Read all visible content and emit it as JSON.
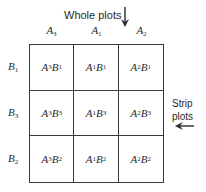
{
  "diagram": {
    "whole_plots_label": "Whole plots",
    "strip_plots_label": [
      "Strip",
      "plots"
    ],
    "columns": [
      {
        "factor": "A",
        "sub": "3"
      },
      {
        "factor": "A",
        "sub": "1"
      },
      {
        "factor": "A",
        "sub": "2"
      }
    ],
    "rows": [
      {
        "factor": "B",
        "sub": "1"
      },
      {
        "factor": "B",
        "sub": "3"
      },
      {
        "factor": "B",
        "sub": "2"
      }
    ],
    "cells": [
      [
        [
          "3",
          "1"
        ],
        [
          "1",
          "1"
        ],
        [
          "2",
          "1"
        ]
      ],
      [
        [
          "3",
          "3"
        ],
        [
          "1",
          "3"
        ],
        [
          "2",
          "3"
        ]
      ],
      [
        [
          "3",
          "2"
        ],
        [
          "1",
          "2"
        ],
        [
          "2",
          "2"
        ]
      ]
    ],
    "arrows": {
      "whole_plots": "down-arrow",
      "strip_plots": "left-arrow"
    },
    "line_color": "#3a3a3a"
  }
}
